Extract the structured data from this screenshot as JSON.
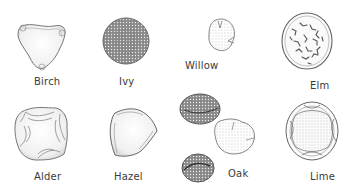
{
  "figure": {
    "grains": [
      {
        "id": "birch",
        "label": "Birch"
      },
      {
        "id": "ivy",
        "label": "Ivy"
      },
      {
        "id": "willow",
        "label": "Willow"
      },
      {
        "id": "elm",
        "label": "Elm"
      },
      {
        "id": "alder",
        "label": "Alder"
      },
      {
        "id": "hazel",
        "label": "Hazel"
      },
      {
        "id": "oak",
        "label": "Oak"
      },
      {
        "id": "lime",
        "label": "Lime"
      }
    ]
  },
  "colors": {
    "outline": "#6b6b6b",
    "fill": "#f2f2f2",
    "stipple": "#4a4a4a",
    "background": "#ffffff"
  }
}
